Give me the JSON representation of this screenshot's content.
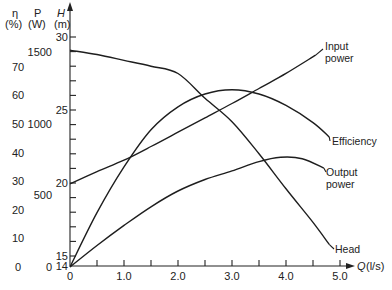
{
  "chart_data": {
    "type": "line",
    "title": "",
    "xlabel": "Q (l/s)",
    "x_axis": {
      "label_symbol": "Q",
      "label_unit": "(l/s)",
      "range": [
        0,
        5.0
      ],
      "tick_labels": [
        "0",
        "1.0",
        "2.0",
        "3.0",
        "4.0",
        "5.0"
      ],
      "tick_values": [
        0,
        1,
        2,
        3,
        4,
        5
      ],
      "minor_tick_values": [
        0.5,
        1.5,
        2.5,
        3.5,
        4.5
      ]
    },
    "y_axes": [
      {
        "id": "eta",
        "symbol": "η",
        "unit": "(%)",
        "range": [
          0,
          75
        ],
        "tick_values": [
          0,
          10,
          20,
          30,
          40,
          50,
          60,
          70
        ],
        "tick_labels": [
          "0",
          "10",
          "20",
          "30",
          "40",
          "50",
          "60",
          "70"
        ]
      },
      {
        "id": "P",
        "symbol": "P",
        "unit": "(W)",
        "range": [
          0,
          1600
        ],
        "tick_values": [
          0,
          500,
          1000,
          1500
        ],
        "tick_labels": [
          "0",
          "500",
          "1000",
          "1500"
        ]
      },
      {
        "id": "H",
        "symbol": "H",
        "unit": "(m)",
        "range": [
          14,
          31
        ],
        "broken_axis_origin": 14,
        "tick_values": [
          14,
          15,
          20,
          25,
          30
        ],
        "tick_labels": [
          "14",
          "15",
          "20",
          "25",
          "30"
        ],
        "minor_tick_values": [
          16,
          17,
          18,
          19,
          21,
          22,
          23,
          24,
          26,
          27,
          28,
          29
        ]
      }
    ],
    "series": [
      {
        "name": "Input power",
        "label_lines": [
          "Input",
          "power"
        ],
        "axis": "P",
        "x": [
          0,
          0.5,
          1.0,
          1.5,
          2.0,
          2.5,
          3.0,
          3.5,
          4.0,
          4.55
        ],
        "y": [
          580,
          665,
          745,
          840,
          940,
          1040,
          1140,
          1245,
          1350,
          1478
        ]
      },
      {
        "name": "Efficiency",
        "label_lines": [
          "Efficiency"
        ],
        "axis": "eta",
        "x": [
          0,
          0.5,
          1.0,
          1.5,
          2.0,
          2.5,
          3.0,
          3.5,
          4.0,
          4.5,
          4.8
        ],
        "y": [
          0,
          19,
          35,
          48,
          56,
          60.5,
          62,
          60.5,
          56.5,
          50.5,
          45.5
        ]
      },
      {
        "name": "Output power",
        "label_lines": [
          "Output",
          "power"
        ],
        "axis": "P",
        "x": [
          0,
          0.5,
          1.0,
          1.5,
          2.0,
          2.5,
          3.0,
          3.5,
          3.9,
          4.3,
          4.7
        ],
        "y": [
          0,
          150,
          290,
          420,
          530,
          610,
          670,
          735,
          765,
          755,
          690
        ]
      },
      {
        "name": "Head",
        "label_lines": [
          "Head"
        ],
        "axis": "H",
        "x": [
          0,
          0.5,
          1.0,
          1.5,
          2.0,
          2.5,
          3.0,
          3.5,
          4.0,
          4.5,
          4.8
        ],
        "y": [
          29.1,
          28.8,
          28.4,
          28.0,
          27.5,
          25.8,
          24.2,
          22.0,
          19.6,
          17.3,
          15.8
        ]
      }
    ],
    "grid": false,
    "legend": "inline labels at right end of each curve"
  }
}
